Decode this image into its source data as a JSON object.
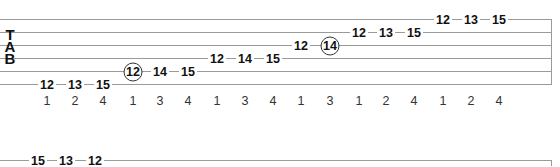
{
  "tablature": {
    "clef": [
      "T",
      "A",
      "B"
    ],
    "system1": {
      "string_y": [
        19,
        32,
        45,
        58,
        71,
        84
      ],
      "notes": [
        {
          "fret": "12",
          "string": 6,
          "x": 47,
          "finger": "1",
          "circled": false
        },
        {
          "fret": "13",
          "string": 6,
          "x": 75,
          "finger": "2",
          "circled": false
        },
        {
          "fret": "15",
          "string": 6,
          "x": 103,
          "finger": "4",
          "circled": false
        },
        {
          "fret": "12",
          "string": 5,
          "x": 133,
          "finger": "1",
          "circled": true
        },
        {
          "fret": "14",
          "string": 5,
          "x": 160,
          "finger": "3",
          "circled": false
        },
        {
          "fret": "15",
          "string": 5,
          "x": 188,
          "finger": "4",
          "circled": false
        },
        {
          "fret": "12",
          "string": 4,
          "x": 217,
          "finger": "1",
          "circled": false
        },
        {
          "fret": "14",
          "string": 4,
          "x": 245,
          "finger": "3",
          "circled": false
        },
        {
          "fret": "15",
          "string": 4,
          "x": 273,
          "finger": "4",
          "circled": false
        },
        {
          "fret": "12",
          "string": 3,
          "x": 301,
          "finger": "1",
          "circled": false
        },
        {
          "fret": "14",
          "string": 3,
          "x": 330,
          "finger": "3",
          "circled": true
        },
        {
          "fret": "12",
          "string": 2,
          "x": 359,
          "finger": "1",
          "circled": false
        },
        {
          "fret": "13",
          "string": 2,
          "x": 386,
          "finger": "2",
          "circled": false
        },
        {
          "fret": "15",
          "string": 2,
          "x": 414,
          "finger": "4",
          "circled": false
        },
        {
          "fret": "12",
          "string": 1,
          "x": 443,
          "finger": "1",
          "circled": false
        },
        {
          "fret": "13",
          "string": 1,
          "x": 471,
          "finger": "2",
          "circled": false
        },
        {
          "fret": "15",
          "string": 1,
          "x": 499,
          "finger": "4",
          "circled": false
        }
      ]
    },
    "system2": {
      "notes": [
        {
          "fret": "15",
          "string": 1,
          "x": 38
        },
        {
          "fret": "13",
          "string": 1,
          "x": 66
        },
        {
          "fret": "12",
          "string": 1,
          "x": 95
        }
      ]
    }
  }
}
